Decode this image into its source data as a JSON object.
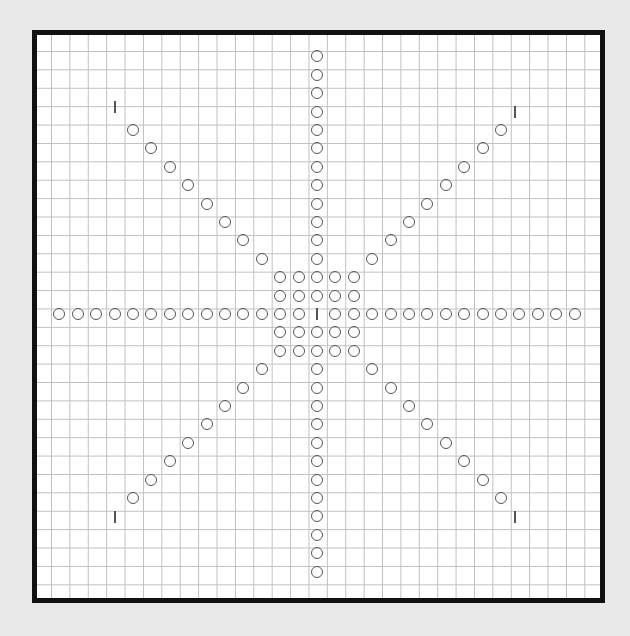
{
  "pattern": {
    "title": "",
    "grid_step_px": 18.4,
    "center": [
      317,
      314
    ],
    "colors": {
      "background": "#e9e9e9",
      "frame": "#111111",
      "grid": "#bfbfbf",
      "symbol": "#555555"
    },
    "arms": {
      "vertical_each_side": 12,
      "horizontal_each_side": 12,
      "diagonal_each_side": 8
    },
    "center_block": "5x5 circles with center marker",
    "corner_markers": [
      [
        115,
        107
      ],
      [
        515,
        112
      ],
      [
        115,
        517
      ],
      [
        515,
        517
      ]
    ]
  }
}
